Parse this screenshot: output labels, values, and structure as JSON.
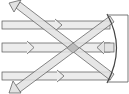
{
  "diagram": {
    "title": "Parallel light rays reflecting off a concave mirror",
    "colors": {
      "beam_fill": "#e6e6e6",
      "beam_stroke": "#555555",
      "overlap_fill": "#bdbdbd",
      "mirror_stroke": "#444444",
      "background": "#ffffff"
    },
    "incoming_beams": [
      {
        "name": "top-beam",
        "y_top": 21,
        "y_bottom": 29,
        "x_start": 2,
        "x_end": 110,
        "arrow_x": 62
      },
      {
        "name": "middle-beam",
        "y_top": 43,
        "y_bottom": 52,
        "x_start": 2,
        "x_end": 110,
        "arrow_x": 33
      },
      {
        "name": "bottom-beam",
        "y_top": 72,
        "y_bottom": 80,
        "x_start": 2,
        "x_end": 110,
        "arrow_x": 64
      }
    ],
    "reflected_beams": [
      {
        "name": "reflected-up-left",
        "from": [
          112,
          78
        ],
        "to": [
          10,
          3
        ]
      },
      {
        "name": "reflected-down-left",
        "from": [
          112,
          18
        ],
        "to": [
          10,
          92
        ]
      },
      {
        "name": "reflected-center-left",
        "arrow_x": 98,
        "y": 47
      }
    ],
    "mirror": {
      "type": "concave",
      "x_top": 108,
      "x_mid": 118,
      "y_top": 15,
      "y_bottom": 82,
      "frame_right": 128
    },
    "focal_point": [
      73,
      49
    ]
  }
}
